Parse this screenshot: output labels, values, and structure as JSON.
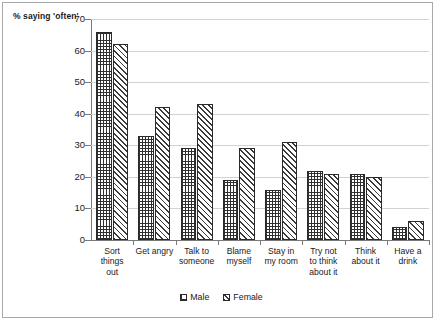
{
  "chart_data": {
    "type": "bar",
    "title": "",
    "xlabel": "",
    "ylabel": "% saying 'often'",
    "ylim": [
      0,
      70
    ],
    "ytick_step": 10,
    "yticks": [
      0,
      10,
      20,
      30,
      40,
      50,
      60,
      70
    ],
    "grid": true,
    "legend_position": "bottom",
    "categories": [
      "Sort things out",
      "Get angry",
      "Talk to someone",
      "Blame myself",
      "Stay in my room",
      "Try not to think about it",
      "Think about it",
      "Have a drink"
    ],
    "category_lines": [
      [
        "Sort",
        "things",
        "out"
      ],
      [
        "Get angry"
      ],
      [
        "Talk to",
        "someone"
      ],
      [
        "Blame",
        "myself"
      ],
      [
        "Stay in",
        "my room"
      ],
      [
        "Try not",
        "to think",
        "about it"
      ],
      [
        "Think",
        "about it"
      ],
      [
        "Have a",
        "drink"
      ]
    ],
    "series": [
      {
        "name": "Male",
        "pattern": "cross-hatch",
        "values": [
          66,
          33,
          29,
          19,
          16,
          22,
          21,
          4
        ]
      },
      {
        "name": "Female",
        "pattern": "diagonal-hatch",
        "values": [
          62,
          42,
          43,
          29,
          31,
          21,
          20,
          6
        ]
      }
    ]
  },
  "legend": {
    "items": [
      {
        "label": "Male"
      },
      {
        "label": "Female"
      }
    ]
  }
}
